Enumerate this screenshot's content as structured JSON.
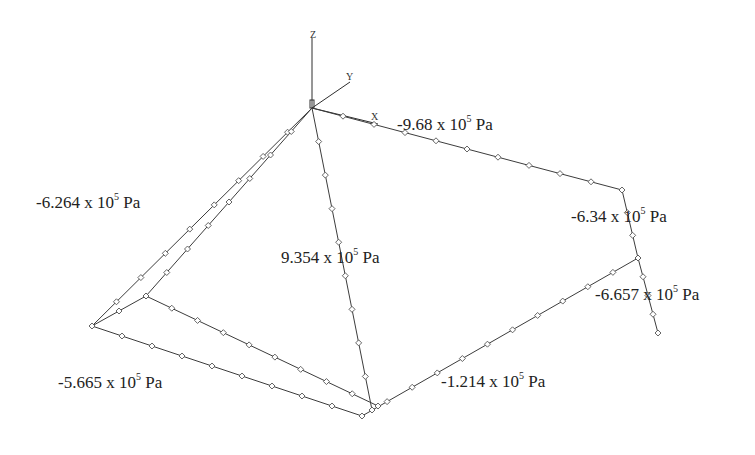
{
  "diagram": {
    "type": "3d-structural-frame-pressure",
    "background": "#ffffff",
    "line_color": "#3c3c3c",
    "axes": {
      "z": "Z",
      "y": "Y",
      "x": "X"
    },
    "labels": [
      {
        "id": "top_edge",
        "coef": "-9.68",
        "times": "x 10",
        "exp": "5",
        "unit": "Pa"
      },
      {
        "id": "left_edge",
        "coef": "-6.264",
        "times": "x 10",
        "exp": "5",
        "unit": "Pa"
      },
      {
        "id": "right_upper",
        "coef": "-6.34",
        "times": "x 10",
        "exp": "5",
        "unit": "Pa"
      },
      {
        "id": "diagonal",
        "coef": "9.354",
        "times": "x 10",
        "exp": "5",
        "unit": "Pa"
      },
      {
        "id": "right_lower",
        "coef": "-6.657",
        "times": "x 10",
        "exp": "5",
        "unit": "Pa"
      },
      {
        "id": "bottom_left",
        "coef": "-5.665",
        "times": "x 10",
        "exp": "5",
        "unit": "Pa"
      },
      {
        "id": "bottom_right",
        "coef": "-1.214",
        "times": "x 10",
        "exp": "5",
        "unit": "Pa"
      }
    ]
  }
}
